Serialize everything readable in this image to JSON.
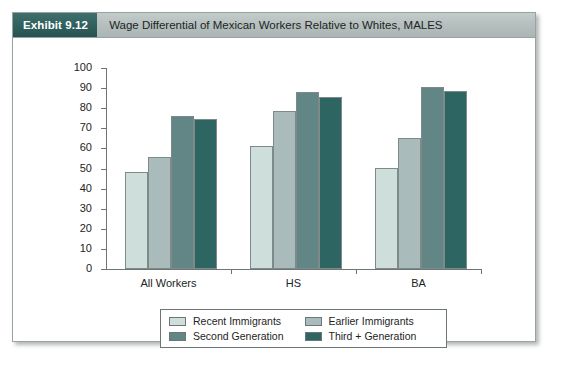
{
  "exhibit": {
    "number_label": "Exhibit 9.12",
    "title": "Wage Differential of Mexican Workers Relative to Whites, MALES"
  },
  "theme": {
    "header_badge_bg": "#2f605e",
    "header_bar_bg": "#b6c0bf",
    "axis_color": "#6c7676",
    "text_color": "#1d2424",
    "card_border": "#9aa3a3"
  },
  "chart_data": {
    "type": "bar",
    "title": "Wage Differential of Mexican Workers Relative to Whites, MALES",
    "xlabel": "",
    "ylabel": "",
    "ylim": [
      0,
      100
    ],
    "yticks": [
      0,
      10,
      20,
      30,
      40,
      50,
      60,
      70,
      80,
      90,
      100
    ],
    "ytick_labels": [
      "0",
      "10",
      "20",
      "30",
      "40",
      "50",
      "60",
      "70",
      "80",
      "90",
      "100"
    ],
    "grid": false,
    "legend_position": "bottom",
    "categories": [
      "All Workers",
      "HS",
      "BA"
    ],
    "series": [
      {
        "name": "Recent Immigrants",
        "color": "#cddedb",
        "values": [
          48.5,
          61.0,
          50.5
        ]
      },
      {
        "name": "Earlier Immigrants",
        "color": "#a9bcbb",
        "values": [
          55.5,
          78.5,
          65.0
        ]
      },
      {
        "name": "Second Generation",
        "color": "#628586",
        "values": [
          76.0,
          88.0,
          90.5
        ]
      },
      {
        "name": "Third + Generation",
        "color": "#2d6562",
        "values": [
          74.5,
          85.5,
          88.5
        ]
      }
    ]
  }
}
